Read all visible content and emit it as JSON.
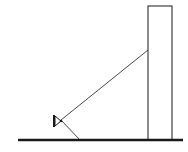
{
  "diagram": {
    "colors": {
      "stroke": "#1a1a1a",
      "background": "#ffffff"
    },
    "ground": {
      "x1": 18,
      "y1": 140,
      "x2": 183,
      "y2": 140,
      "width": 2.5
    },
    "building": {
      "x": 148,
      "y": 6,
      "width": 24,
      "height": 134
    },
    "ray_to_wall": {
      "x1": 61,
      "y1": 120,
      "x2": 148,
      "y2": 50
    },
    "ray_to_ground": {
      "x1": 61,
      "y1": 120,
      "x2": 80,
      "y2": 140
    },
    "light_source": {
      "x": 56,
      "y": 120
    }
  }
}
